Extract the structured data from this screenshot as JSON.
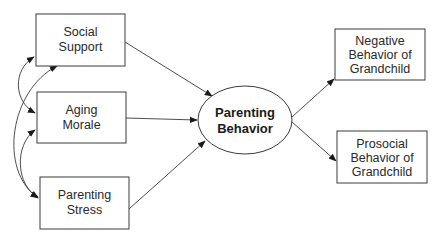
{
  "diagram": {
    "type": "path-model",
    "nodes": {
      "social_support": {
        "lines": [
          "Social",
          "Support"
        ],
        "shape": "rectangle"
      },
      "aging_morale": {
        "lines": [
          "Aging",
          "Morale"
        ],
        "shape": "rectangle"
      },
      "parenting_stress": {
        "lines": [
          "Parenting",
          "Stress"
        ],
        "shape": "rectangle"
      },
      "parenting_behavior": {
        "lines": [
          "Parenting",
          "Behavior"
        ],
        "shape": "ellipse",
        "bold": true
      },
      "negative_behavior": {
        "lines": [
          "Negative",
          "Behavior of",
          "Grandchild"
        ],
        "shape": "rectangle"
      },
      "prosocial_behavior": {
        "lines": [
          "Prosocial",
          "Behavior of",
          "Grandchild"
        ],
        "shape": "rectangle"
      }
    },
    "edges": [
      {
        "from": "social_support",
        "to": "parenting_behavior",
        "type": "directed"
      },
      {
        "from": "aging_morale",
        "to": "parenting_behavior",
        "type": "directed"
      },
      {
        "from": "parenting_stress",
        "to": "parenting_behavior",
        "type": "directed"
      },
      {
        "from": "parenting_behavior",
        "to": "negative_behavior",
        "type": "directed"
      },
      {
        "from": "parenting_behavior",
        "to": "prosocial_behavior",
        "type": "directed"
      },
      {
        "from": "social_support",
        "to": "aging_morale",
        "type": "covariance"
      },
      {
        "from": "aging_morale",
        "to": "parenting_stress",
        "type": "covariance"
      },
      {
        "from": "social_support",
        "to": "parenting_stress",
        "type": "covariance"
      }
    ],
    "colors": {
      "stroke": "#3a3a3a",
      "text": "#2a2a2a",
      "background": "#ffffff"
    }
  }
}
